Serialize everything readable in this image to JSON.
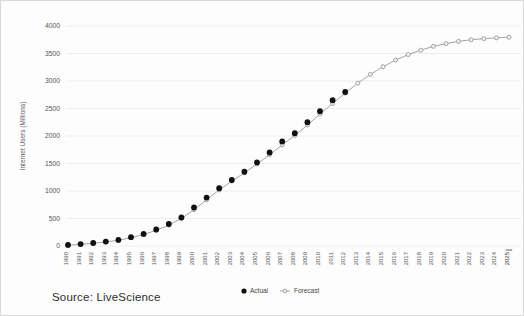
{
  "chart_data": {
    "type": "line",
    "title": "",
    "xlabel": "",
    "ylabel": "Internet Users (Millions)",
    "ylim": [
      0,
      4000
    ],
    "yticks": [
      0,
      500,
      1000,
      1500,
      2000,
      2500,
      3000,
      3500,
      4000
    ],
    "grid": true,
    "legend_position": "bottom-center",
    "categories": [
      "1990",
      "1991",
      "1992",
      "1993",
      "1994",
      "1995",
      "1996",
      "1997",
      "1998",
      "1999",
      "2000",
      "2001",
      "2002",
      "2003",
      "2004",
      "2005",
      "2006",
      "2007",
      "2008",
      "2009",
      "2010",
      "2011",
      "2012",
      "2013",
      "2014",
      "2015",
      "2016",
      "2017",
      "2018",
      "2019",
      "2020",
      "2021",
      "2022",
      "2023",
      "2024",
      "2025"
    ],
    "highlighted_category": "2025",
    "series": [
      {
        "name": "Actual",
        "marker": "filled-circle",
        "color": "#111111",
        "values": [
          20,
          35,
          55,
          80,
          110,
          160,
          220,
          300,
          400,
          520,
          700,
          880,
          1050,
          1200,
          1350,
          1520,
          1700,
          1900,
          2050,
          2250,
          2450,
          2650,
          2800,
          null,
          null,
          null,
          null,
          null,
          null,
          null,
          null,
          null,
          null,
          null,
          null,
          null
        ]
      },
      {
        "name": "Forecast",
        "marker": "open-circle-line",
        "color": "#9a9a9a",
        "values": [
          15,
          30,
          50,
          75,
          105,
          150,
          210,
          285,
          380,
          500,
          660,
          840,
          1020,
          1180,
          1330,
          1490,
          1660,
          1840,
          2010,
          2200,
          2400,
          2590,
          2780,
          2960,
          3120,
          3260,
          3380,
          3480,
          3560,
          3630,
          3680,
          3720,
          3750,
          3770,
          3785,
          3795
        ]
      }
    ]
  },
  "legend": {
    "actual_label": "Actual",
    "forecast_label": "Forecast"
  },
  "source": {
    "text": "Source: LiveScience"
  }
}
